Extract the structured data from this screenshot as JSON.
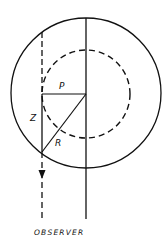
{
  "diagram": {
    "labels": {
      "p": "P",
      "z": "Z",
      "r": "R",
      "observer": "OBSERVER"
    },
    "colors": {
      "stroke": "#111111",
      "background": "#ffffff"
    },
    "elements": {
      "outer_circle": {
        "style": "solid"
      },
      "inner_circle": {
        "style": "dashed"
      },
      "central_axis": {
        "style": "solid"
      },
      "line_of_sight": {
        "style": "dashed",
        "arrow": "down"
      },
      "impact_parameter": {
        "label": "P"
      },
      "depth_segment": {
        "label": "Z"
      },
      "radius_segment": {
        "label": "R"
      }
    }
  }
}
